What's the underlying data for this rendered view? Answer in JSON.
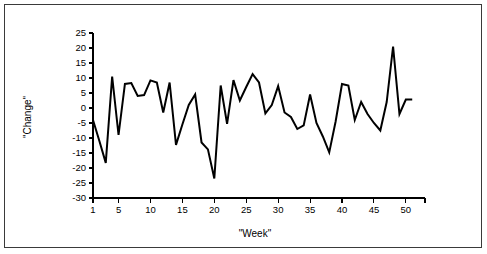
{
  "figure": {
    "border_color": "#3a3a3a",
    "background": "#ffffff"
  },
  "chart_data": {
    "type": "line",
    "title": "",
    "xlabel": "\"Week\"",
    "ylabel": "\"Change\"",
    "xlim": [
      1,
      53
    ],
    "ylim": [
      -30,
      25
    ],
    "grid": false,
    "legend": false,
    "line_color": "#000000",
    "x_ticks": [
      1,
      5,
      10,
      15,
      20,
      25,
      30,
      35,
      40,
      45,
      50
    ],
    "x_tick_labels": [
      "1",
      "5",
      "10",
      "15",
      "20",
      "25",
      "30",
      "35",
      "40",
      "45",
      "50"
    ],
    "y_ticks": [
      -30,
      -25,
      -20,
      -15,
      -10,
      -5,
      0,
      5,
      10,
      15,
      20,
      25
    ],
    "y_tick_labels": [
      "-30",
      "-25",
      "-20",
      "-15",
      "-10",
      "-5",
      "0",
      "5",
      "10",
      "15",
      "20",
      "25"
    ],
    "x": [
      1,
      2,
      3,
      4,
      5,
      6,
      7,
      8,
      9,
      10,
      11,
      12,
      13,
      14,
      15,
      16,
      17,
      18,
      19,
      20,
      21,
      22,
      23,
      24,
      25,
      26,
      27,
      28,
      29,
      30,
      31,
      32,
      33,
      34,
      35,
      36,
      37,
      38,
      39,
      40,
      41,
      42,
      43,
      44,
      45,
      46,
      47,
      48,
      49,
      50,
      51
    ],
    "values": [
      -4.0,
      -11.0,
      -18.3,
      10.5,
      -9.0,
      8.0,
      8.3,
      4.0,
      4.3,
      9.2,
      8.5,
      -1.5,
      8.5,
      -12.3,
      -5.5,
      1.0,
      4.5,
      -11.5,
      -13.8,
      -23.5,
      7.5,
      -5.3,
      9.3,
      2.5,
      7.0,
      11.3,
      8.5,
      -1.8,
      1.0,
      7.3,
      -1.5,
      -3.0,
      -7.0,
      -5.8,
      4.5,
      -5.0,
      -9.5,
      -14.8,
      -4.5,
      8.0,
      7.5,
      -4.0,
      2.0,
      -2.0,
      -5.0,
      -7.5,
      2.0,
      20.5,
      -2.0,
      2.8,
      2.8
    ]
  }
}
